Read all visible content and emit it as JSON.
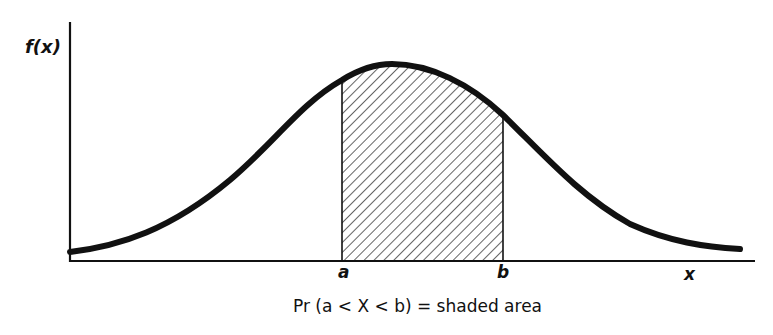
{
  "figure": {
    "y_axis_label": "f(x)",
    "x_axis_label": "x",
    "markers": [
      {
        "name": "a",
        "label": "a"
      },
      {
        "name": "b",
        "label": "b"
      }
    ],
    "caption": "Pr (a < X < b) = shaded area",
    "curve": "bell-shaped probability density function",
    "shaded_region": "area under f(x) between a and b, diagonal hatching",
    "colors": {
      "line": "#111111",
      "background": "#ffffff",
      "hatch": "#222222"
    }
  }
}
